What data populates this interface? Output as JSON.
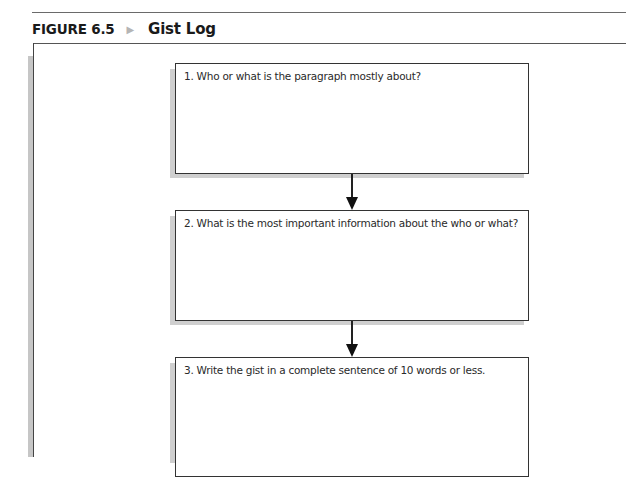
{
  "figure": {
    "label": "FIGURE 6.5",
    "separator_icon": "▶",
    "title": "Gist Log"
  },
  "gist_log": {
    "steps": [
      {
        "number": 1,
        "prompt": "1. Who or what is the paragraph mostly about?"
      },
      {
        "number": 2,
        "prompt": "2. What is the most important information about the who or what?"
      },
      {
        "number": 3,
        "prompt": "3. Write the gist in a complete sentence of 10 words or less."
      }
    ]
  },
  "colors": {
    "border": "#333333",
    "shadow": "#c6c6c6",
    "separator": "#b5b5b5"
  }
}
